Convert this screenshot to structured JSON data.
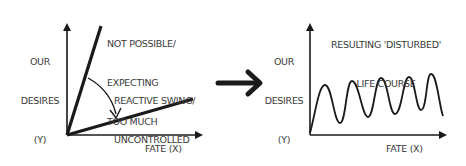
{
  "left_panel": {
    "y_axis_label": [
      "OUR",
      "DESIRES",
      "(Y)"
    ],
    "x_axis_label": "FATE (X)",
    "steep_line_label": [
      "NOT POSSIBLE/",
      "EXPECTING",
      "TOO MUCH"
    ],
    "shallow_line_label": [
      "REACTIVE SWING/",
      "UNCONTROLLED"
    ]
  },
  "right_panel": {
    "y_axis_label": [
      "OUR",
      "DESIRES",
      "(Y)"
    ],
    "x_axis_label": "FATE (X)",
    "title": [
      "RESULTING 'DISTURBED'",
      "LIFE COURSE"
    ]
  },
  "connector": {
    "icon": "arrow-right-icon"
  },
  "colors": {
    "ink": "#1a1a1a",
    "text": "#3a3a3a",
    "background": "#ffffff"
  }
}
